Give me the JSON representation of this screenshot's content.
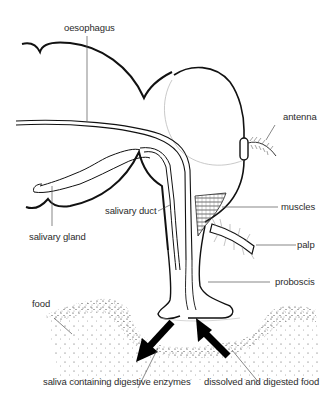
{
  "diagram": {
    "labels": {
      "oesophagus": "oesophagus",
      "antenna": "antenna",
      "salivary_duct": "salivary duct",
      "muscles": "muscles",
      "salivary_gland": "salivary gland",
      "palp": "palp",
      "proboscis": "proboscis",
      "food": "food",
      "saliva": "saliva containing digestive enzymes",
      "dissolved": "dissolved and digested food"
    },
    "colors": {
      "line": "#111111",
      "label_text": "#2b2b2b",
      "leader": "#555555",
      "faint": "#bbbbbb"
    }
  }
}
